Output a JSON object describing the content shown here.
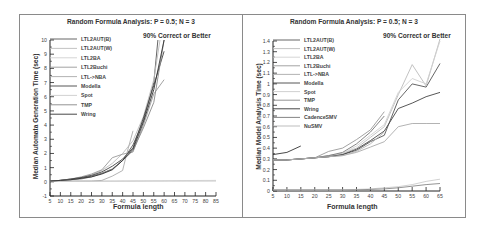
{
  "chart_data": [
    {
      "type": "line",
      "title": "Random Formula Analysis: P = 0.5; N = 3",
      "annotation": "90% Correct or Better",
      "xlabel": "Formula length",
      "ylabel": "Median Automata Generation Time (sec)",
      "xlim": [
        5,
        85
      ],
      "ylim": [
        -1,
        10
      ],
      "xticks": [
        5,
        10,
        15,
        20,
        25,
        30,
        35,
        40,
        45,
        50,
        55,
        60,
        65,
        70,
        75,
        80,
        85
      ],
      "yticks": [
        -1,
        0,
        1,
        2,
        3,
        4,
        5,
        6,
        7,
        8,
        9,
        10
      ],
      "legend_position": "upper left",
      "grid": false,
      "series": [
        {
          "name": "LTL2AUT(B)",
          "color": "#555555",
          "x": [
            5,
            10,
            15,
            20,
            25,
            30,
            35,
            40,
            45,
            50,
            55,
            57
          ],
          "y": [
            0.05,
            0.1,
            0.15,
            0.25,
            0.4,
            0.6,
            0.9,
            1.5,
            2.6,
            4.3,
            7.0,
            10
          ]
        },
        {
          "name": "LTL2AUT(W)",
          "color": "#bbbbbb",
          "x": [
            5,
            10,
            15,
            20,
            25,
            30,
            35,
            40,
            45,
            50,
            55,
            58
          ],
          "y": [
            0.05,
            0.1,
            0.2,
            0.3,
            0.5,
            0.8,
            1.3,
            2.0,
            2.9,
            4.6,
            7.2,
            10
          ]
        },
        {
          "name": "LTL2BA",
          "color": "#d0d0d0",
          "x": [
            5,
            85
          ],
          "y": [
            0.05,
            0.1
          ]
        },
        {
          "name": "LTL2Buchi",
          "color": "#999999",
          "x": [
            5,
            10,
            15,
            20,
            25,
            30,
            35,
            40,
            45,
            50,
            55,
            60
          ],
          "y": [
            0.05,
            0.1,
            0.2,
            0.35,
            0.55,
            0.85,
            1.7,
            1.95,
            2.1,
            4.0,
            6.2,
            7.2
          ]
        },
        {
          "name": "LTL->NBA",
          "color": "#aaaaaa",
          "x": [
            5,
            10,
            15,
            20,
            25,
            30,
            35,
            40,
            42,
            45
          ],
          "y": [
            0.05,
            0.05,
            0.05,
            0.05,
            0.05,
            0.1,
            0.4,
            0.8,
            2.0,
            3.6
          ]
        },
        {
          "name": "Modella",
          "color": "#444444",
          "x": [
            5,
            10,
            15,
            20,
            25,
            30,
            35,
            40,
            45,
            50,
            55,
            60
          ],
          "y": [
            0.05,
            0.1,
            0.2,
            0.3,
            0.45,
            0.7,
            1.1,
            1.6,
            2.4,
            4.5,
            6.8,
            9.2
          ]
        },
        {
          "name": "Spot",
          "color": "#cccccc",
          "x": [
            5,
            85
          ],
          "y": [
            0.02,
            0.05
          ]
        },
        {
          "name": "TMP",
          "color": "#888888",
          "x": [
            5,
            10,
            15,
            20,
            25,
            30,
            35,
            40,
            45,
            50,
            55,
            60
          ],
          "y": [
            0.05,
            0.1,
            0.15,
            0.2,
            0.35,
            0.6,
            0.9,
            1.5,
            2.2,
            3.8,
            5.6,
            10
          ]
        },
        {
          "name": "Wring",
          "color": "#333333",
          "x": [
            5,
            10,
            15,
            20,
            25,
            30,
            35,
            40,
            45,
            50,
            55,
            60
          ],
          "y": [
            0.05,
            0.1,
            0.15,
            0.25,
            0.35,
            0.55,
            0.85,
            1.5,
            2.3,
            4.2,
            6.5,
            10
          ]
        }
      ]
    },
    {
      "type": "line",
      "title": "Random Formula Analysis: P = 0.5; N = 3",
      "annotation": "90% Correct or Better",
      "xlabel": "Formula length",
      "ylabel": "Median Model Analysis Time (sec)",
      "xlim": [
        5,
        65
      ],
      "ylim": [
        0,
        1.4
      ],
      "xticks": [
        5,
        10,
        15,
        20,
        25,
        30,
        35,
        40,
        45,
        50,
        55,
        60,
        65
      ],
      "yticks": [
        0,
        0.1,
        0.2,
        0.3,
        0.4,
        0.5,
        0.6,
        0.7,
        0.8,
        0.9,
        1,
        1.1,
        1.2,
        1.3,
        1.4
      ],
      "legend_position": "upper left",
      "grid": false,
      "series": [
        {
          "name": "LTL2AUT(B)",
          "color": "#555555",
          "x": [
            5,
            10,
            15,
            20,
            25,
            30,
            35,
            40,
            45,
            50,
            55,
            60,
            65
          ],
          "y": [
            0.29,
            0.29,
            0.3,
            0.31,
            0.32,
            0.34,
            0.38,
            0.46,
            0.52,
            0.85,
            1.0,
            0.97,
            1.19
          ]
        },
        {
          "name": "LTL2AUT(W)",
          "color": "#bbbbbb",
          "x": [
            5,
            10,
            15,
            20,
            25,
            30,
            35,
            40,
            45,
            50,
            55,
            60,
            65
          ],
          "y": [
            0.29,
            0.29,
            0.3,
            0.31,
            0.33,
            0.35,
            0.4,
            0.5,
            0.6,
            0.9,
            1.18,
            0.98,
            1.42
          ]
        },
        {
          "name": "LTL2BA",
          "color": "#d0d0d0",
          "x": [
            5,
            10,
            15,
            20,
            25,
            30,
            35,
            40,
            45,
            50,
            55,
            60,
            65
          ],
          "y": [
            0.29,
            0.29,
            0.3,
            0.31,
            0.33,
            0.35,
            0.42,
            0.52,
            0.62,
            0.92,
            1.05,
            1.0,
            1.4
          ]
        },
        {
          "name": "LTL2Buchi",
          "color": "#999999",
          "x": [
            5,
            10,
            15,
            20,
            25,
            30,
            35,
            40,
            45
          ],
          "y": [
            0.29,
            0.29,
            0.3,
            0.31,
            0.37,
            0.4,
            0.48,
            0.57,
            0.74
          ]
        },
        {
          "name": "LTL->NBA",
          "color": "#aaaaaa",
          "x": [
            5,
            10,
            15,
            20,
            25,
            30,
            35,
            40,
            45,
            50,
            55,
            60,
            65
          ],
          "y": [
            0.29,
            0.29,
            0.3,
            0.31,
            0.32,
            0.33,
            0.36,
            0.41,
            0.46,
            0.6,
            0.63,
            0.63,
            0.63
          ]
        },
        {
          "name": "Modella",
          "color": "#444444",
          "x": [
            5,
            10,
            15,
            20,
            25,
            30,
            35,
            40,
            45,
            50,
            55,
            60,
            65
          ],
          "y": [
            0.29,
            0.29,
            0.3,
            0.31,
            0.32,
            0.34,
            0.39,
            0.47,
            0.56,
            0.77,
            0.82,
            0.88,
            0.92
          ]
        },
        {
          "name": "Spot",
          "color": "#cccccc",
          "x": [
            5,
            10,
            15,
            20,
            25,
            30,
            35,
            40,
            45,
            50,
            55,
            60,
            65
          ],
          "y": [
            0.01,
            0.01,
            0.01,
            0.01,
            0.01,
            0.01,
            0.015,
            0.02,
            0.03,
            0.04,
            0.06,
            0.09,
            0.11
          ]
        },
        {
          "name": "TMP",
          "color": "#888888",
          "x": [
            5,
            10,
            15,
            20,
            25,
            30,
            35,
            40,
            45,
            50,
            55,
            60,
            65
          ],
          "y": [
            0.01,
            0.01,
            0.01,
            0.01,
            0.01,
            0.01,
            0.01,
            0.015,
            0.02,
            0.03,
            0.045,
            0.06,
            0.07
          ]
        },
        {
          "name": "Wring",
          "color": "#333333",
          "x": [
            5,
            10,
            15
          ],
          "y": [
            0.34,
            0.36,
            0.42
          ]
        },
        {
          "name": "CadenceSMV",
          "color": "#777777",
          "x": [
            5,
            10,
            15,
            20,
            25,
            30,
            35,
            40,
            45
          ],
          "y": [
            0.29,
            0.29,
            0.3,
            0.31,
            0.33,
            0.36,
            0.44,
            0.55,
            0.7
          ]
        },
        {
          "name": "NuSMV",
          "color": "#b5b5b5",
          "x": [
            5,
            10,
            15,
            20,
            25,
            30,
            35,
            40,
            45
          ],
          "y": [
            0.29,
            0.29,
            0.3,
            0.31,
            0.32,
            0.33,
            0.37,
            0.44,
            0.55
          ]
        }
      ]
    }
  ]
}
